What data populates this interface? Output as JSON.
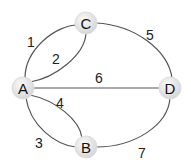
{
  "diagram": {
    "type": "graph",
    "nodes": [
      {
        "id": "A",
        "label": "A",
        "x": 23,
        "y": 88
      },
      {
        "id": "B",
        "label": "B",
        "x": 86,
        "y": 147
      },
      {
        "id": "C",
        "label": "C",
        "x": 86,
        "y": 23
      },
      {
        "id": "D",
        "label": "D",
        "x": 170,
        "y": 88
      }
    ],
    "edges": [
      {
        "label": "1",
        "from": "A",
        "to": "C"
      },
      {
        "label": "2",
        "from": "A",
        "to": "C"
      },
      {
        "label": "3",
        "from": "A",
        "to": "B"
      },
      {
        "label": "4",
        "from": "A",
        "to": "B"
      },
      {
        "label": "5",
        "from": "C",
        "to": "D"
      },
      {
        "label": "6",
        "from": "A",
        "to": "D"
      },
      {
        "label": "7",
        "from": "B",
        "to": "D"
      }
    ],
    "colors": {
      "edge": "#555555",
      "node_fill": "#e6e6e6",
      "node_text": "#111111"
    }
  }
}
